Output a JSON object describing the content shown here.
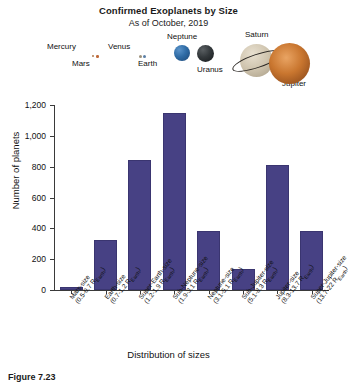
{
  "figure": {
    "caption": "Figure 7.23"
  },
  "chart_data": {
    "type": "bar",
    "title": "Confirmed Exoplanets by Size",
    "subtitle": "As of October, 2019",
    "xlabel": "Distribution of sizes",
    "ylabel": "Number of planets",
    "ylim": [
      0,
      1200
    ],
    "yticks": [
      0,
      200,
      400,
      600,
      800,
      1000,
      1200
    ],
    "ytick_labels": [
      "0",
      "200",
      "400",
      "600",
      "800",
      "1,000",
      "1,200"
    ],
    "grid": false,
    "legend": "none",
    "bar_color": "#474184",
    "categories": [
      "Mars-size",
      "Earth-size",
      "Super-Earth-size",
      "Sub-Neptune-size",
      "Neptune-size",
      "Sub-Jupiter-size",
      "Jupiter-size",
      "Super-Jupiter-size"
    ],
    "category_ranges": [
      "(0.5-0.7 R",
      "(0.7-1.2 R",
      "(1.2-1.9 R",
      "(1.9-3.1 R",
      "(3.1-5.1 R",
      "(5.1-8.3 R",
      "(8.3-13.7 R",
      "(13.7-22 R"
    ],
    "range_unit_sub": "Earth",
    "range_suffix": ")",
    "values": [
      20,
      325,
      845,
      1150,
      385,
      135,
      810,
      380
    ]
  },
  "planets": [
    {
      "name": "Mercury",
      "icon": "mercury-planet-icon"
    },
    {
      "name": "Mars",
      "icon": "mars-planet-icon"
    },
    {
      "name": "Venus",
      "icon": "venus-planet-icon"
    },
    {
      "name": "Earth",
      "icon": "earth-planet-icon"
    },
    {
      "name": "Neptune",
      "icon": "neptune-planet-icon"
    },
    {
      "name": "Uranus",
      "icon": "uranus-planet-icon"
    },
    {
      "name": "Saturn",
      "icon": "saturn-planet-icon"
    },
    {
      "name": "Jupiter",
      "icon": "jupiter-planet-icon"
    }
  ]
}
